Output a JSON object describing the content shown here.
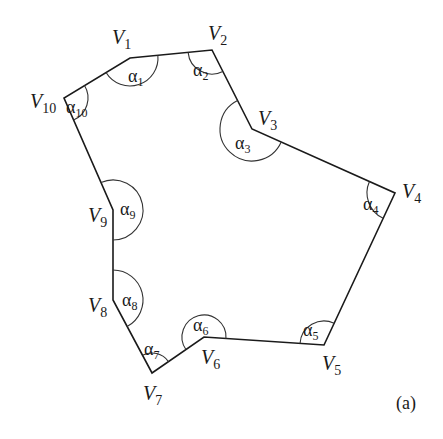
{
  "figure": {
    "caption": "(a)",
    "polygon": {
      "vertices": [
        {
          "name": "V",
          "sub": "1",
          "x": 130,
          "y": 58,
          "lx": 112,
          "ly": 44
        },
        {
          "name": "V",
          "sub": "2",
          "x": 212,
          "y": 50,
          "lx": 208,
          "ly": 40
        },
        {
          "name": "V",
          "sub": "3",
          "x": 252,
          "y": 129,
          "lx": 258,
          "ly": 125
        },
        {
          "name": "V",
          "sub": "4",
          "x": 395,
          "y": 193,
          "lx": 402,
          "ly": 198
        },
        {
          "name": "V",
          "sub": "5",
          "x": 324,
          "y": 345,
          "lx": 322,
          "ly": 370
        },
        {
          "name": "V",
          "sub": "6",
          "x": 204,
          "y": 337,
          "lx": 201,
          "ly": 364
        },
        {
          "name": "V",
          "sub": "7",
          "x": 152,
          "y": 373,
          "lx": 143,
          "ly": 400
        },
        {
          "name": "V",
          "sub": "8",
          "x": 113,
          "y": 300,
          "lx": 88,
          "ly": 312
        },
        {
          "name": "V",
          "sub": "9",
          "x": 113,
          "y": 210,
          "lx": 88,
          "ly": 222
        },
        {
          "name": "V",
          "sub": "10",
          "x": 64,
          "y": 98,
          "lx": 30,
          "ly": 108
        }
      ],
      "angles": [
        {
          "symbol": "α",
          "sub": "1",
          "x": 128,
          "y": 82
        },
        {
          "symbol": "α",
          "sub": "2",
          "x": 193,
          "y": 76
        },
        {
          "symbol": "α",
          "sub": "3",
          "x": 235,
          "y": 149
        },
        {
          "symbol": "α",
          "sub": "4",
          "x": 363,
          "y": 210
        },
        {
          "symbol": "α",
          "sub": "5",
          "x": 303,
          "y": 336
        },
        {
          "symbol": "α",
          "sub": "6",
          "x": 193,
          "y": 331
        },
        {
          "symbol": "α",
          "sub": "7",
          "x": 144,
          "y": 355
        },
        {
          "symbol": "α",
          "sub": "8",
          "x": 122,
          "y": 306
        },
        {
          "symbol": "α",
          "sub": "9",
          "x": 120,
          "y": 215
        },
        {
          "symbol": "α",
          "sub": "10",
          "x": 66,
          "y": 113
        }
      ]
    }
  }
}
